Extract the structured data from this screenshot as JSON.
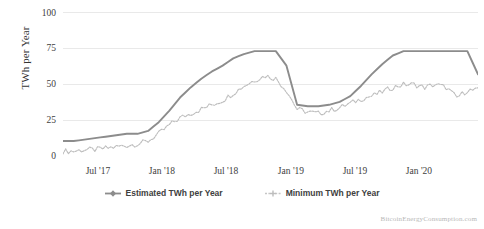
{
  "watermark": "BitcoinEnergyConsumption.com",
  "legend": {
    "items": [
      {
        "label": "Estimated TWh per Year",
        "color": "#8c8c8c",
        "marker": "diamond-marker"
      },
      {
        "label": "Minimum TWh per Year",
        "color": "#bdbdbd",
        "marker": "cross-marker"
      }
    ]
  },
  "chart_data": {
    "type": "line",
    "title": "",
    "subtitle": "",
    "xlabel": "",
    "ylabel": "TWh per Year",
    "ylim": [
      0,
      100
    ],
    "yticks": [
      0,
      25,
      50,
      75,
      100
    ],
    "ytick_labels": [
      "0",
      "25",
      "50",
      "75",
      "100"
    ],
    "xtick_labels": [
      "Jul '17",
      "Jan '18",
      "Jul '18",
      "Jan '19",
      "Jul '19",
      "Jan '20"
    ],
    "x_range": [
      "2017-03",
      "2020-06"
    ],
    "grid": true,
    "legend_position": "bottom",
    "annotations": [
      "BitcoinEnergyConsumption.com"
    ],
    "x": [
      "2017-03",
      "2017-04",
      "2017-05",
      "2017-06",
      "2017-07",
      "2017-08",
      "2017-09",
      "2017-10",
      "2017-11",
      "2017-12",
      "2018-01",
      "2018-02",
      "2018-03",
      "2018-04",
      "2018-05",
      "2018-06",
      "2018-07",
      "2018-08",
      "2018-09",
      "2018-10",
      "2018-11",
      "2018-12",
      "2019-01",
      "2019-02",
      "2019-03",
      "2019-04",
      "2019-05",
      "2019-06",
      "2019-07",
      "2019-08",
      "2019-09",
      "2019-10",
      "2019-11",
      "2019-12",
      "2020-01",
      "2020-02",
      "2020-03",
      "2020-04",
      "2020-05",
      "2020-06"
    ],
    "series": [
      {
        "name": "Estimated TWh per Year",
        "color": "#8c8c8c",
        "style": "solid",
        "values": [
          11,
          11,
          12,
          13,
          14,
          15,
          16,
          16,
          18,
          24,
          32,
          41,
          48,
          54,
          59,
          63,
          68,
          71,
          73,
          73,
          73,
          63,
          36,
          35,
          35,
          36,
          38,
          42,
          49,
          57,
          64,
          70,
          73,
          73,
          73,
          73,
          73,
          73,
          73,
          57
        ]
      },
      {
        "name": "Minimum TWh per Year",
        "color": "#bdbdbd",
        "style": "dotted",
        "values": [
          4,
          4,
          5,
          5,
          6,
          7,
          8,
          9,
          11,
          16,
          22,
          27,
          30,
          33,
          36,
          39,
          44,
          49,
          53,
          56,
          54,
          46,
          33,
          31,
          30,
          32,
          34,
          37,
          40,
          42,
          45,
          48,
          50,
          50,
          48,
          50,
          48,
          41,
          46,
          46
        ]
      }
    ]
  }
}
